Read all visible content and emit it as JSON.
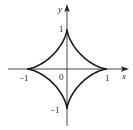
{
  "figure": {
    "title": "",
    "curve": "astroid",
    "equation_hint": "x^(2/3) + y^(2/3) = 1",
    "axis_labels": {
      "x": "x",
      "y": "y"
    },
    "tick_labels": {
      "origin": "0",
      "x_pos": "1",
      "x_neg": "−1",
      "y_pos": "1",
      "y_neg": "−1"
    },
    "colors": {
      "curve": "#1a1a1a",
      "axes": "#333333",
      "background": "#ffffff"
    },
    "geometry": {
      "origin_px": [
        67,
        69
      ],
      "unit_px": 40,
      "x_axis_range_px": [
        8,
        128
      ],
      "y_axis_range_px": [
        5,
        126
      ]
    },
    "cusps": [
      [
        1,
        0
      ],
      [
        0,
        1
      ],
      [
        -1,
        0
      ],
      [
        0,
        -1
      ]
    ]
  }
}
